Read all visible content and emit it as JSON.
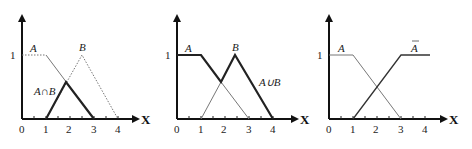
{
  "figure": {
    "panels": [
      {
        "id": "intersection",
        "y_tick_label": "1",
        "x_tick_labels": [
          "0",
          "1",
          "2",
          "3",
          "4"
        ],
        "x_axis_label": "X",
        "set_labels": {
          "a": "A",
          "b": "B",
          "result": "A∩B"
        },
        "sets": {
          "A": [
            [
              0,
              1
            ],
            [
              1,
              1
            ],
            [
              3,
              0
            ]
          ],
          "B": [
            [
              1,
              0
            ],
            [
              2.5,
              1
            ],
            [
              4,
              0
            ]
          ],
          "A_and_B": [
            [
              1,
              0
            ],
            [
              1.83,
              0.55
            ],
            [
              3,
              0
            ]
          ]
        }
      },
      {
        "id": "union",
        "y_tick_label": "1",
        "x_tick_labels": [
          "0",
          "1",
          "2",
          "3",
          "4"
        ],
        "x_axis_label": "X",
        "set_labels": {
          "a": "A",
          "b": "B",
          "result": "A∪B"
        },
        "sets": {
          "A": [
            [
              0,
              1
            ],
            [
              1,
              1
            ],
            [
              3,
              0
            ]
          ],
          "B": [
            [
              1,
              0
            ],
            [
              2.5,
              1
            ],
            [
              4,
              0
            ]
          ],
          "A_or_B": [
            [
              0,
              1
            ],
            [
              1,
              1
            ],
            [
              1.83,
              0.55
            ],
            [
              2.5,
              1
            ],
            [
              4,
              0
            ]
          ]
        }
      },
      {
        "id": "complement",
        "y_tick_label": "1",
        "x_tick_labels": [
          "0",
          "1",
          "2",
          "3",
          "4"
        ],
        "x_axis_label": "X",
        "set_labels": {
          "a": "A",
          "result": "A"
        },
        "sets": {
          "A": [
            [
              0,
              1
            ],
            [
              1,
              1
            ],
            [
              3,
              0
            ]
          ],
          "not_A": [
            [
              1,
              0
            ],
            [
              3,
              1
            ],
            [
              4,
              1
            ]
          ]
        }
      }
    ]
  }
}
